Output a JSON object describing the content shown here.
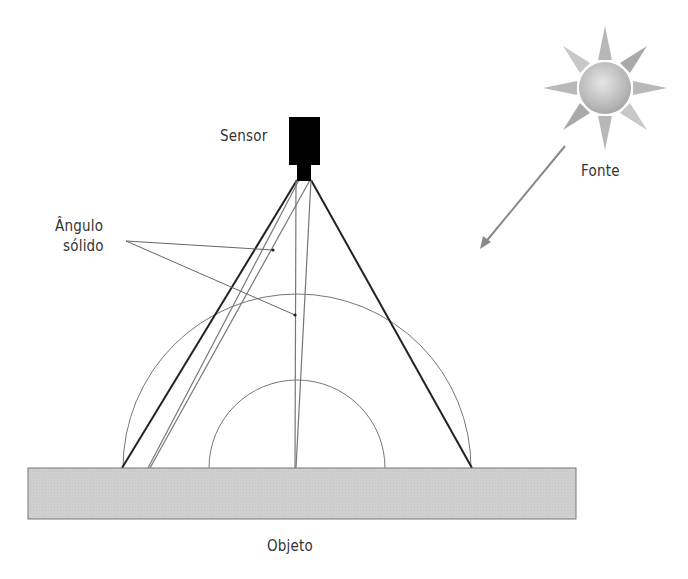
{
  "labels": {
    "sensor": "Sensor",
    "source": "Fonte",
    "solid_angle_line1": "Ângulo",
    "solid_angle_line2": "sólido",
    "object": "Objeto"
  },
  "colors": {
    "sensor_body": "#000000",
    "object_fill": "#cfcfcf",
    "object_stroke": "#777777",
    "thin_line": "#777777",
    "thick_line": "#222222",
    "sun_core": "#bdbdbd",
    "text": "#333333"
  },
  "icons": {
    "sensor": "sensor-camera-icon",
    "source": "sun-icon",
    "incident_ray": "arrow-down-left-icon"
  }
}
